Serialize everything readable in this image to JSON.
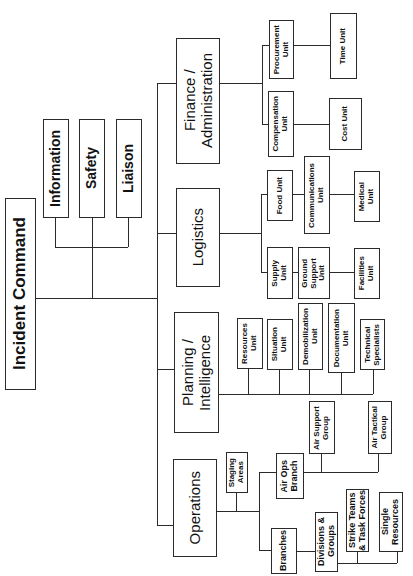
{
  "incident_command": {
    "label": "Incident Command"
  },
  "command_staff": [
    {
      "label": "Information"
    },
    {
      "label": "Safety"
    },
    {
      "label": "Liaison"
    }
  ],
  "sections": {
    "finance": {
      "label": "Finance /\nAdministration",
      "units": [
        {
          "label": "Procurement\nUnit"
        },
        {
          "label": "Time Unit"
        },
        {
          "label": "Compensation\nUnit"
        },
        {
          "label": "Cost Unit"
        }
      ]
    },
    "logistics": {
      "label": "Logistics",
      "units": [
        {
          "label": "Food Unit"
        },
        {
          "label": "Communications\nUnit"
        },
        {
          "label": "Medical\nUnit"
        },
        {
          "label": "Supply\nUnit"
        },
        {
          "label": "Ground\nSupport\nUnit"
        },
        {
          "label": "Facilities\nUnit"
        }
      ]
    },
    "planning": {
      "label": "Planning /\nIntelligence",
      "units": [
        {
          "label": "Resources\nUnit"
        },
        {
          "label": "Situation\nUnit"
        },
        {
          "label": "Demobilization\nUnit"
        },
        {
          "label": "Documentation\nUnit"
        },
        {
          "label": "Technical\nSpecialists"
        }
      ]
    },
    "operations": {
      "label": "Operations",
      "units": [
        {
          "label": "Staging\nAreas"
        },
        {
          "label": "Air Ops\nBranch"
        },
        {
          "label": "Air Support\nGroup"
        },
        {
          "label": "Air Tactical\nGroup"
        },
        {
          "label": "Branches"
        },
        {
          "label": "Divisions &\nGroups"
        },
        {
          "label": "Strike Teams\n& Task Forces"
        },
        {
          "label": "Single\nResources"
        }
      ]
    }
  }
}
